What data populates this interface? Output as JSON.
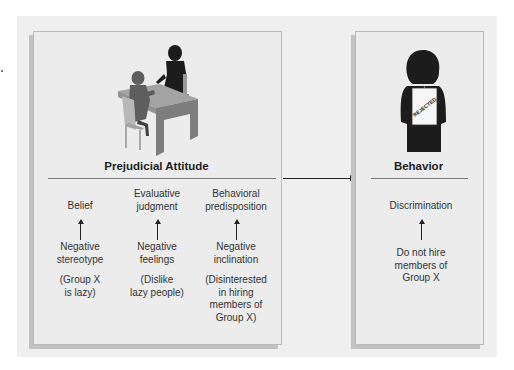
{
  "figure": {
    "left_panel": {
      "title": "Prejudicial Attitude",
      "illustration": "interview-desk-icon",
      "columns": [
        {
          "heading": [
            "Belief"
          ],
          "component": [
            "Negative",
            "stereotype"
          ],
          "example": [
            "(Group X",
            "is lazy)"
          ]
        },
        {
          "heading": [
            "Evaluative",
            "judgment"
          ],
          "component": [
            "Negative",
            "feelings"
          ],
          "example": [
            "(Dislike",
            "lazy people)"
          ]
        },
        {
          "heading": [
            "Behavioral",
            "predisposition"
          ],
          "component": [
            "Negative",
            "inclination"
          ],
          "example": [
            "(Disinterested",
            "in hiring",
            "members of",
            "Group X)"
          ]
        }
      ]
    },
    "connector": "right-arrow-icon",
    "right_panel": {
      "title": "Behavior",
      "illustration": "rejected-person-icon",
      "sign_text": "REJECTED",
      "column": {
        "heading": [
          "Discrimination"
        ],
        "component": [
          "Do not hire",
          "members of",
          "Group X"
        ]
      }
    },
    "colors": {
      "background": "#efefef",
      "panel": "#ececec",
      "panel_border": "#b9b9b9",
      "shadow": "#c2c2c2",
      "silhouette": "#1c1c1c",
      "desk": "#8c8c8c"
    }
  }
}
